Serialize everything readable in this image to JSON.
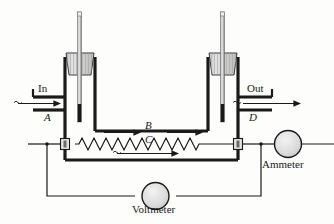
{
  "figure": {
    "background_color": "#fdfdfb",
    "line_color": "#1a1a1a",
    "fill_gray": "#d8d8d8",
    "thermometer_stem_color": "#8a8a8a"
  },
  "labels": {
    "inlet": "In",
    "outlet": "Out",
    "point_a": "A",
    "point_b": "B",
    "point_c": "C",
    "point_d": "D",
    "ammeter": "Ammeter",
    "voltmeter": "Voltmeter"
  },
  "components": {
    "left_thermometer": "thermometer-icon",
    "right_thermometer": "thermometer-icon",
    "left_stopper": "stopper-icon",
    "right_stopper": "stopper-icon",
    "heating_coil": "resistor-coil-icon",
    "left_terminal": "terminal-block-icon",
    "right_terminal": "terminal-block-icon",
    "ammeter_symbol": "meter-circle-icon",
    "voltmeter_symbol": "meter-circle-icon",
    "inlet_flow_arrow": "flow-arrow-icon",
    "outlet_flow_arrow": "flow-arrow-icon",
    "tube_flow_arrow_left": "flow-arrow-icon",
    "tube_flow_arrow_right": "flow-arrow-icon",
    "tube_flow_arrow_bottom": "flow-arrow-icon"
  }
}
